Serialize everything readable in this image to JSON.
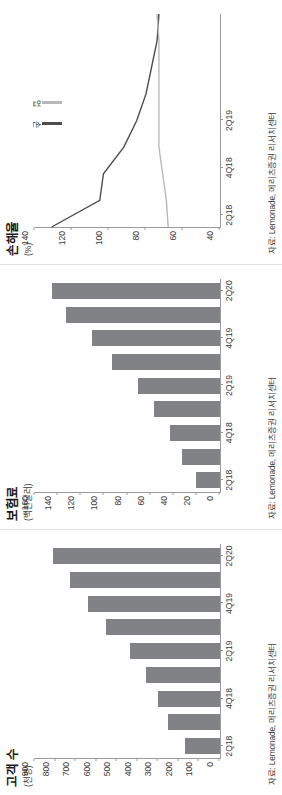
{
  "figure": {
    "orientation": "rotated-90-ccw",
    "background": "#ffffff",
    "bar_color": "#808285",
    "line_color_dark": "#4d4d4d",
    "line_color_light": "#b8b8b8",
    "axis_color": "#9a9a9a"
  },
  "panels": [
    {
      "id": "loss-ratio",
      "title": "손해율",
      "y_unit": "(%)",
      "source": "자료: Lemonade, 메리츠증권 리서치센터",
      "legend": [
        {
          "label": "손",
          "color": "#4d4d4d"
        },
        {
          "label": "업",
          "color": "#b8b8b8"
        }
      ]
    },
    {
      "id": "premium",
      "title": "보험료",
      "y_unit": "(백만달러)",
      "source": "자료: Lemonade, 메리츠증권 리서치센터"
    },
    {
      "id": "customers",
      "title": "고객 수",
      "y_unit": "(천명)",
      "source": "자료: Lemonade, 메리츠증권 리서치센터"
    }
  ],
  "chart_data": [
    {
      "id": "loss-ratio",
      "type": "line",
      "title": "손해율",
      "xlabel": "",
      "ylabel": "(%)",
      "ylim": [
        40,
        140
      ],
      "yticks": [
        40,
        60,
        80,
        100,
        120,
        140
      ],
      "grid": false,
      "legend_position": "top-right",
      "x": [
        "2Q18",
        "3Q18",
        "4Q18",
        "1Q19",
        "2Q19",
        "3Q19",
        "4Q19",
        "1Q20",
        "2Q20"
      ],
      "xticks": [
        "2Q18",
        "4Q18",
        "2Q19"
      ],
      "series": [
        {
          "name": "손해율",
          "color": "#4d4d4d",
          "values": [
            131,
            105,
            103,
            92,
            85,
            80,
            77,
            74,
            73
          ]
        },
        {
          "name": "업계 평균",
          "color": "#b8b8b8",
          "values": [
            68,
            69,
            71,
            73,
            73,
            73,
            73,
            73,
            74
          ]
        }
      ]
    },
    {
      "id": "premium",
      "type": "bar",
      "title": "보험료",
      "xlabel": "",
      "ylabel": "(백만달러)",
      "ylim": [
        0,
        160
      ],
      "yticks": [
        0,
        20,
        40,
        60,
        80,
        100,
        120,
        140,
        160
      ],
      "grid": false,
      "categories": [
        "2Q18",
        "4Q18",
        "2Q19",
        "4Q19",
        "2Q20"
      ],
      "x": [
        "2Q18",
        "3Q18",
        "4Q18",
        "1Q19",
        "2Q19",
        "3Q19",
        "4Q19",
        "1Q20",
        "2Q20"
      ],
      "values": [
        21,
        33,
        43,
        57,
        71,
        93,
        111,
        133,
        145
      ]
    },
    {
      "id": "customers",
      "type": "bar",
      "title": "고객 수",
      "xlabel": "",
      "ylabel": "(천명)",
      "ylim": [
        0,
        900
      ],
      "yticks": [
        0,
        100,
        200,
        300,
        400,
        500,
        600,
        700,
        800,
        900
      ],
      "grid": false,
      "categories": [
        "2Q18",
        "4Q18",
        "2Q19",
        "4Q19",
        "2Q20"
      ],
      "x": [
        "2Q18",
        "3Q18",
        "4Q18",
        "1Q19",
        "2Q19",
        "3Q19",
        "4Q19",
        "1Q20",
        "2Q20"
      ],
      "values": [
        172,
        253,
        300,
        362,
        437,
        557,
        643,
        729,
        814
      ]
    }
  ]
}
